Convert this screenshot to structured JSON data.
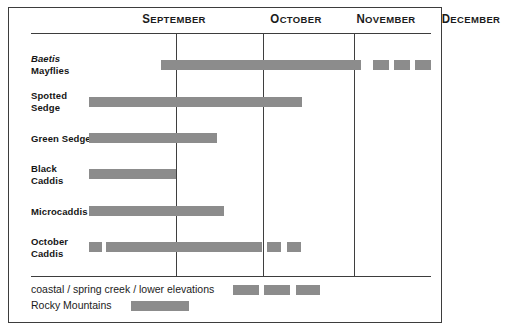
{
  "chart_data": {
    "type": "bar",
    "title": "",
    "subtitle": "",
    "xlabel": "",
    "ylabel": "",
    "grid": true,
    "legend_position": "bottom",
    "axis": {
      "categories": [
        "September",
        "October",
        "November",
        "December"
      ],
      "tick_positions_px": [
        175,
        262,
        353
      ],
      "plot_left_px": 88,
      "plot_right_px": 422,
      "range_note": "Horizontal timeline spanning September through December"
    },
    "months": [
      {
        "name": "September",
        "label_x": 96,
        "label_width": 154
      },
      {
        "name": "October",
        "label_x": 253,
        "label_width": 84
      },
      {
        "name": "November",
        "label_x": 340,
        "label_width": 90
      },
      {
        "name": "December",
        "label_x": 430,
        "label_width": 80
      }
    ],
    "series": [
      {
        "name": "Baetis Mayflies",
        "label_lines": [
          "Baetis",
          "Mayflies"
        ],
        "scientific": true,
        "row_y": 45,
        "bar_y": 52,
        "segments": [
          {
            "start_px": 160,
            "end_px": 360,
            "type": "rocky-mountains"
          },
          {
            "start_px": 372,
            "end_px": 388,
            "type": "coastal"
          },
          {
            "start_px": 393,
            "end_px": 409,
            "type": "coastal"
          },
          {
            "start_px": 414,
            "end_px": 430,
            "type": "coastal"
          }
        ]
      },
      {
        "name": "Spotted Sedge",
        "label_lines": [
          "Spotted",
          "Sedge"
        ],
        "scientific": false,
        "row_y": 82,
        "bar_y": 89,
        "segments": [
          {
            "start_px": 88,
            "end_px": 301,
            "type": "rocky-mountains"
          }
        ]
      },
      {
        "name": "Green Sedge",
        "label_lines": [
          "Green Sedge"
        ],
        "scientific": false,
        "row_y": 125,
        "bar_y": 125,
        "segments": [
          {
            "start_px": 88,
            "end_px": 216,
            "type": "rocky-mountains"
          }
        ]
      },
      {
        "name": "Black Caddis",
        "label_lines": [
          "Black",
          "Caddis"
        ],
        "scientific": false,
        "row_y": 155,
        "bar_y": 161,
        "segments": [
          {
            "start_px": 88,
            "end_px": 175,
            "type": "rocky-mountains"
          }
        ]
      },
      {
        "name": "Microcaddis",
        "label_lines": [
          "Microcaddis"
        ],
        "scientific": false,
        "row_y": 198,
        "bar_y": 198,
        "segments": [
          {
            "start_px": 88,
            "end_px": 223,
            "type": "rocky-mountains"
          }
        ]
      },
      {
        "name": "October Caddis",
        "label_lines": [
          "October",
          "Caddis"
        ],
        "scientific": false,
        "row_y": 228,
        "bar_y": 234,
        "segments": [
          {
            "start_px": 88,
            "end_px": 101,
            "type": "coastal"
          },
          {
            "start_px": 105,
            "end_px": 261,
            "type": "rocky-mountains"
          },
          {
            "start_px": 266,
            "end_px": 280,
            "type": "coastal"
          },
          {
            "start_px": 286,
            "end_px": 300,
            "type": "coastal"
          }
        ]
      }
    ],
    "legend": [
      {
        "label": "coastal / spring creek / lower elevations",
        "swatches": [
          {
            "start_px": 202,
            "width_px": 26
          },
          {
            "start_px": 233,
            "width_px": 26
          },
          {
            "start_px": 265,
            "width_px": 24
          }
        ]
      },
      {
        "label": "Rocky Mountains",
        "swatches": [
          {
            "start_px": 100,
            "width_px": 58
          }
        ]
      }
    ],
    "colors": {
      "bar": "#8c8c8c",
      "frame": "#3d3d3d",
      "divider": "#3f3f3f",
      "text": "#161616",
      "background": "#ffffff"
    }
  }
}
